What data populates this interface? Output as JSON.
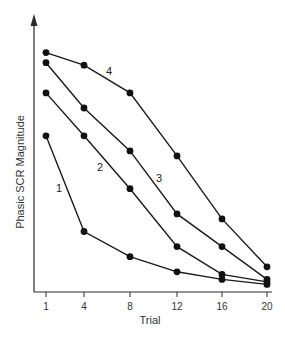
{
  "chart_data": {
    "type": "line",
    "title": "",
    "xlabel": "Trial",
    "ylabel": "Phasic SCR Magnitude",
    "x": [
      1,
      4,
      8,
      12,
      16,
      20
    ],
    "x_tick_labels": [
      "1",
      "4",
      "8",
      "12",
      "16",
      "20"
    ],
    "y_ticks_shown": false,
    "ylim": [
      0,
      100
    ],
    "grid": false,
    "legend": "inline numeric labels next to lines",
    "series": [
      {
        "name": "1",
        "values": [
          62,
          24,
          14,
          8,
          5,
          3
        ]
      },
      {
        "name": "2",
        "values": [
          79,
          62,
          41,
          18,
          7,
          4
        ]
      },
      {
        "name": "3",
        "values": [
          91,
          73,
          56,
          31,
          18,
          5
        ]
      },
      {
        "name": "4",
        "values": [
          95,
          90,
          79,
          54,
          29,
          10
        ]
      }
    ],
    "annotations": [
      {
        "text": "1",
        "near_series": "1"
      },
      {
        "text": "2",
        "near_series": "2"
      },
      {
        "text": "3",
        "near_series": "3"
      },
      {
        "text": "4",
        "near_series": "4"
      }
    ]
  },
  "colors": {
    "line": "#1a1a1a",
    "marker": "#111111",
    "axis": "#2a2a2a",
    "text": "#333333",
    "background": "#ffffff"
  }
}
